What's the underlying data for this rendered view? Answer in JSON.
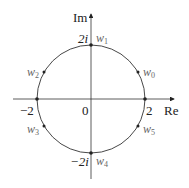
{
  "figure": {
    "axes": {
      "x_label": "Re",
      "y_label": "Im"
    },
    "ticks": {
      "neg_x": "−2",
      "pos_x": "2",
      "origin": "0",
      "pos_y": "2i",
      "neg_y": "−2i"
    },
    "points": [
      {
        "name": "w",
        "sub": "0"
      },
      {
        "name": "w",
        "sub": "1"
      },
      {
        "name": "w",
        "sub": "2"
      },
      {
        "name": "w",
        "sub": "3"
      },
      {
        "name": "w",
        "sub": "4"
      },
      {
        "name": "w",
        "sub": "5"
      }
    ],
    "colors": {
      "curve": "#333333",
      "labels": "#222222",
      "point_labels": "#666666"
    }
  }
}
